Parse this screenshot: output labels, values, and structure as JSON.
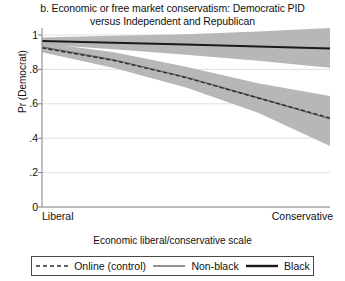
{
  "chart_data": {
    "type": "line",
    "title": "b. Economic or free market conservatism: Democratic PID versus Independent and Republican",
    "title_line1": "b. Economic or free market conservatism: Democratic PID",
    "title_line2": "versus Independent and Republican",
    "xlabel": "Economic liberal/conservative scale",
    "ylabel": "Pr (Democrat)",
    "xlim": [
      0,
      1
    ],
    "ylim": [
      0,
      1
    ],
    "grid": true,
    "grid_axis": "y",
    "legend_position": "below-axes",
    "x_tick_labels": [
      "Liberal",
      "Conservative"
    ],
    "x_tick_values": [
      0,
      1
    ],
    "y_tick_labels": [
      "0",
      ".2",
      ".4",
      ".6",
      ".8",
      "1"
    ],
    "y_tick_values": [
      0,
      0.2,
      0.4,
      0.6,
      0.8,
      1.0
    ],
    "x": [
      0,
      0.25,
      0.5,
      0.75,
      1.0
    ],
    "series": [
      {
        "name": "Black",
        "style": "solid",
        "color": "#1a1a1a",
        "width": 2.0,
        "values": [
          0.965,
          0.955,
          0.945,
          0.933,
          0.922
        ],
        "ci_upper": [
          0.985,
          0.995,
          1.005,
          1.02,
          1.04
        ],
        "ci_lower": [
          0.945,
          0.917,
          0.885,
          0.85,
          0.81
        ],
        "band_color": "#b3b3b3"
      },
      {
        "name": "Non-black",
        "style": "solid",
        "color": "#6e6e6e",
        "width": 1.4,
        "values": [
          0.93,
          0.855,
          0.755,
          0.635,
          0.512
        ],
        "ci_upper": [
          0.955,
          0.9,
          0.815,
          0.72,
          0.645
        ],
        "ci_lower": [
          0.9,
          0.808,
          0.695,
          0.548,
          0.355
        ],
        "band_color": "#b3b3b3"
      },
      {
        "name": "Online (control)",
        "style": "dashed",
        "color": "#2b2b2b",
        "width": 1.4,
        "values": [
          0.925,
          0.852,
          0.752,
          0.634,
          0.518
        ]
      }
    ],
    "legend": [
      {
        "label": "Online (control)",
        "style": "dashed",
        "color": "#2b2b2b",
        "width": 1.4
      },
      {
        "label": "Non-black",
        "style": "solid",
        "color": "#6e6e6e",
        "width": 1.4
      },
      {
        "label": "Black",
        "style": "solid",
        "color": "#1a1a1a",
        "width": 2.2
      }
    ],
    "colors": {
      "band": "#b3b3b3",
      "grid": "#d9d9d9",
      "axis": "#8a8a8a",
      "text": "#111111",
      "background": "#ffffff"
    }
  }
}
